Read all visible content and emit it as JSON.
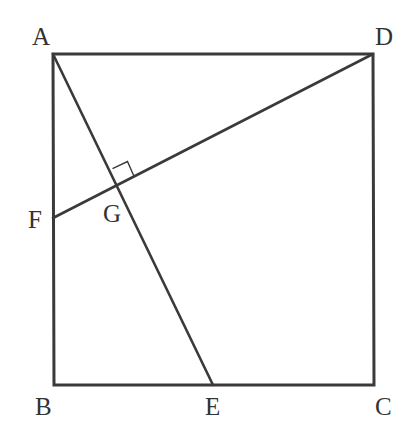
{
  "diagram": {
    "stroke_color": "#3a3a3a",
    "points": {
      "A": {
        "x": 53,
        "y": 54
      },
      "D": {
        "x": 373,
        "y": 54
      },
      "B": {
        "x": 54,
        "y": 385
      },
      "C": {
        "x": 374,
        "y": 385
      },
      "E": {
        "x": 213,
        "y": 385
      },
      "F": {
        "x": 53,
        "y": 218
      },
      "G": {
        "x": 117,
        "y": 185
      }
    },
    "labels": [
      {
        "text": "A",
        "x": 32,
        "y": 45
      },
      {
        "text": "D",
        "x": 375,
        "y": 45
      },
      {
        "text": "F",
        "x": 28,
        "y": 228
      },
      {
        "text": "G",
        "x": 103,
        "y": 222
      },
      {
        "text": "B",
        "x": 35,
        "y": 415
      },
      {
        "text": "E",
        "x": 205,
        "y": 415
      },
      {
        "text": "C",
        "x": 375,
        "y": 415
      }
    ],
    "segments": [
      [
        "A",
        "D"
      ],
      [
        "D",
        "C"
      ],
      [
        "C",
        "B"
      ],
      [
        "B",
        "A"
      ],
      [
        "A",
        "E"
      ],
      [
        "D",
        "F"
      ]
    ],
    "right_angle_at": "G"
  }
}
